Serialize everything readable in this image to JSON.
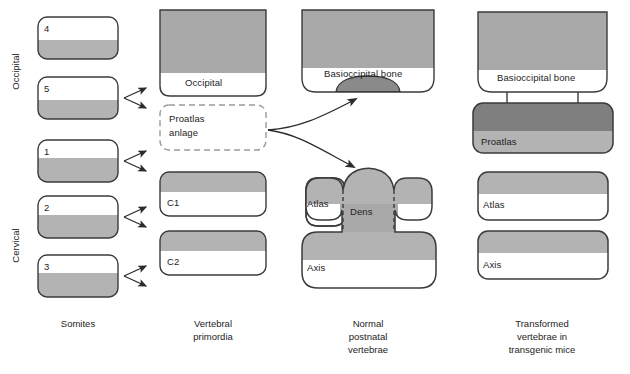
{
  "figure": {
    "type": "diagram"
  },
  "colors": {
    "outline": "#3b3b3b",
    "light_gray": "#b3b3b3",
    "mid_gray": "#9e9e9e",
    "dark_gray": "#7f7f7f",
    "white": "#ffffff",
    "text": "#1d1d1d",
    "dashed_outline": "#8c8c8c"
  },
  "side_labels": {
    "occipital": "Occipital",
    "cervical": "Cervical"
  },
  "column_captions": {
    "c1": "Somites",
    "c2": "Vertebral\nprimordia",
    "c2_line1": "Vertebral",
    "c2_line2": "primordia",
    "c3_line1": "Normal",
    "c3_line2": "postnatal",
    "c3_line3": "vertebrae",
    "c4_line1": "Transformed",
    "c4_line2": "vertebrae in",
    "c4_line3": "transgenic mice"
  },
  "somites": {
    "label": "Somites",
    "items": [
      {
        "number": "4",
        "region": "occipital"
      },
      {
        "number": "5",
        "region": "occipital"
      },
      {
        "number": "1",
        "region": "cervical"
      },
      {
        "number": "2",
        "region": "cervical"
      },
      {
        "number": "3",
        "region": "cervical"
      }
    ]
  },
  "vertebral_primordia": {
    "occipital": "Occipital",
    "proatlas_anlage_line1": "Proatlas",
    "proatlas_anlage_line2": "anlage",
    "c1": "C1",
    "c2": "C2"
  },
  "normal_postnatal": {
    "basioccipital": "Basioccipital bone",
    "atlas": "Atlas",
    "dens": "Dens",
    "axis": "Axis"
  },
  "transformed": {
    "basioccipital": "Basioccipital bone",
    "proatlas": "Proatlas",
    "atlas": "Atlas",
    "axis": "Axis"
  }
}
